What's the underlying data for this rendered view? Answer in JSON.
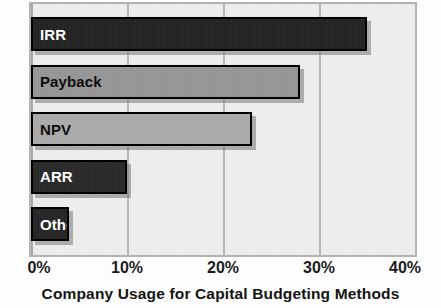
{
  "chart_data": {
    "type": "bar",
    "orientation": "horizontal",
    "title": "Company Usage for Capital Budgeting Methods",
    "xlabel": "",
    "ylabel": "",
    "xlim": [
      0,
      40
    ],
    "grid": true,
    "legend": false,
    "categories": [
      "IRR",
      "Payback",
      "NPV",
      "ARR",
      "Other"
    ],
    "values": [
      35,
      28,
      23,
      10,
      4
    ],
    "tick_labels": [
      "0%",
      "10%",
      "20%",
      "30%",
      "40%"
    ],
    "tick_values": [
      0,
      10,
      20,
      30,
      40
    ],
    "bars": [
      {
        "label": "IRR",
        "value": 35,
        "color": "#242424",
        "text_color": "#ffffff"
      },
      {
        "label": "Payback",
        "value": 28,
        "color": "#999999",
        "text_color": "#0d0d0d"
      },
      {
        "label": "NPV",
        "value": 23,
        "color": "#aeaeae",
        "text_color": "#0d0d0d"
      },
      {
        "label": "ARR",
        "value": 10,
        "color": "#2a2a2a",
        "text_color": "#ffffff"
      },
      {
        "label": "Other",
        "value": 4,
        "color": "#272727",
        "text_color": "#ffffff"
      }
    ],
    "colors": {
      "plot_background": "#efefef",
      "frame": "#b4b4b4",
      "gridline": "#b9b9b9",
      "text": "#141414"
    }
  }
}
